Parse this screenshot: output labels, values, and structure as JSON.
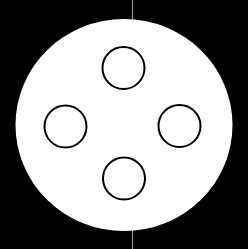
{
  "canvas": {
    "width": 248,
    "height": 249,
    "background": "#000000"
  },
  "axis_line": {
    "x": 132.5,
    "color": "#9a9a9a",
    "width": 1
  },
  "outer_disc": {
    "cx": 124,
    "cy": 125,
    "rx": 108.5,
    "ry": 106,
    "fill": "#ffffff"
  },
  "holes": [
    {
      "name": "top",
      "cx": 123.5,
      "cy": 68,
      "r": 21
    },
    {
      "name": "left",
      "cx": 65.5,
      "cy": 126.5,
      "r": 21
    },
    {
      "name": "right",
      "cx": 179.5,
      "cy": 126,
      "r": 21
    },
    {
      "name": "bottom",
      "cx": 124,
      "cy": 178.5,
      "r": 21
    }
  ],
  "hole_style": {
    "stroke": "#000000",
    "stroke_width": 2,
    "fill": "#ffffff"
  }
}
